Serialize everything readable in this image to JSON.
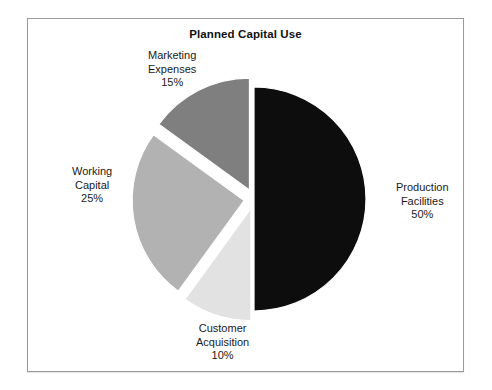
{
  "chart": {
    "title": "Planned Capital Use",
    "frame_border_color": "#9a9a9a",
    "background_color": "#ffffff"
  },
  "chart_data": {
    "type": "pie",
    "title": "Planned Capital Use",
    "xlabel": "",
    "ylabel": "",
    "legend_position": "none",
    "grid": false,
    "labels_outside": true,
    "start_angle_deg": 0,
    "direction": "clockwise",
    "categories": [
      "Production Facilities",
      "Customer Acquisition",
      "Working Capital",
      "Marketing Expenses"
    ],
    "values": [
      50,
      10,
      25,
      15
    ],
    "value_suffix": "%",
    "colors": [
      "#0d0d0d",
      "#e2e2e2",
      "#b2b2b2",
      "#7f7f7f"
    ],
    "exploded": [
      false,
      true,
      true,
      true
    ],
    "slices": [
      {
        "name": "Production Facilities",
        "label_line1": "Production",
        "label_line2": "Facilities",
        "value": 50,
        "value_text": "50%",
        "color": "#0d0d0d",
        "exploded": false,
        "explode_offset": 0,
        "start_deg": 0,
        "end_deg": 180,
        "label_x": 368,
        "label_y": 162
      },
      {
        "name": "Customer Acquisition",
        "label_line1": "Customer",
        "label_line2": "Acquisition",
        "value": 10,
        "value_text": "10%",
        "color": "#e2e2e2",
        "exploded": true,
        "explode_offset": 10,
        "start_deg": 180,
        "end_deg": 216,
        "label_x": 168,
        "label_y": 303
      },
      {
        "name": "Working Capital",
        "label_line1": "Working",
        "label_line2": "Capital",
        "value": 25,
        "value_text": "25%",
        "color": "#b2b2b2",
        "exploded": true,
        "explode_offset": 10,
        "start_deg": 216,
        "end_deg": 306,
        "label_x": 44,
        "label_y": 146
      },
      {
        "name": "Marketing Expenses",
        "label_line1": "Marketing",
        "label_line2": "Expenses",
        "value": 15,
        "value_text": "15%",
        "color": "#7f7f7f",
        "exploded": true,
        "explode_offset": 10,
        "start_deg": 306,
        "end_deg": 360,
        "label_x": 120,
        "label_y": 30
      }
    ],
    "geometry": {
      "center_x": 226,
      "center_y": 180,
      "radius": 112
    }
  }
}
